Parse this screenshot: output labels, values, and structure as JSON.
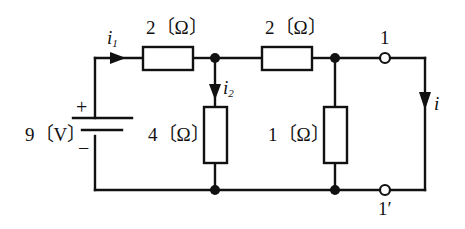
{
  "diagram": {
    "background_color": "#ffffff",
    "line_color": "#111111",
    "source": {
      "label": "9〔V〕",
      "plus_sign": "+",
      "minus_sign": "−",
      "type": "dc-voltage-source-battery"
    },
    "resistors": [
      {
        "id": "r-series-top-left",
        "label": "2〔Ω〕",
        "orientation": "horizontal"
      },
      {
        "id": "r-series-top-right",
        "label": "2〔Ω〕",
        "orientation": "horizontal"
      },
      {
        "id": "r-shunt-middle",
        "label": "4〔Ω〕",
        "orientation": "vertical"
      },
      {
        "id": "r-shunt-right",
        "label": "1〔Ω〕",
        "orientation": "vertical"
      }
    ],
    "currents": [
      {
        "id": "i1",
        "label": "i",
        "subscript": "1",
        "direction": "right"
      },
      {
        "id": "i2",
        "label": "i",
        "subscript": "2",
        "direction": "down"
      },
      {
        "id": "i",
        "label": "i",
        "subscript": "",
        "direction": "down"
      }
    ],
    "terminals": [
      {
        "id": "terminal-1",
        "label": "1"
      },
      {
        "id": "terminal-1-prime",
        "label": "1′"
      }
    ]
  }
}
